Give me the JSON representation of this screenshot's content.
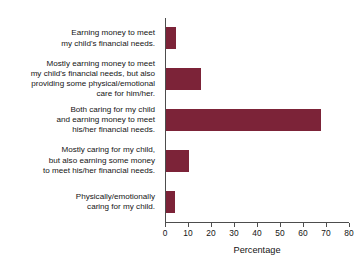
{
  "chart_data": {
    "type": "bar",
    "orientation": "horizontal",
    "title": "",
    "subtitle": "",
    "xlabel": "Percentage",
    "ylabel": "",
    "xlim": [
      0,
      80
    ],
    "xticks": [
      0,
      10,
      20,
      30,
      40,
      50,
      60,
      70,
      80
    ],
    "xtick_labels": [
      "0",
      "10",
      "20",
      "30",
      "40",
      "50",
      "60",
      "70",
      "80"
    ],
    "grid": false,
    "legend": null,
    "bar_color": "#7c2338",
    "axis_color": "#4d4d4d",
    "categories": [
      "Earning money to meet\nmy child's financial needs.",
      "Mostly earning money to meet\nmy child's financial needs, but also\nproviding some physical/emotional\ncare for him/her.",
      "Both caring for my child\nand earning money to meet\nhis/her financial needs.",
      "Mostly caring for my child,\nbut also earning some money\nto meet his/her financial needs.",
      "Physically/emotionally\ncaring for my child."
    ],
    "values": [
      4.5,
      15.0,
      67.5,
      10.0,
      4.0
    ]
  },
  "axis": {
    "x_title": "Percentage"
  }
}
